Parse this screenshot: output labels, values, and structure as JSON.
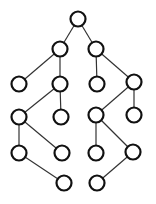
{
  "diagram": {
    "type": "tree",
    "node_radius": 7.5,
    "colors": {
      "node_stroke": "#111111",
      "node_fill": "#ffffff",
      "edge": "#333333",
      "background": "#ffffff"
    },
    "nodes": [
      {
        "id": "n0",
        "x": 78,
        "y": 19
      },
      {
        "id": "n1",
        "x": 60,
        "y": 49
      },
      {
        "id": "n2",
        "x": 96,
        "y": 49
      },
      {
        "id": "n3",
        "x": 19,
        "y": 84
      },
      {
        "id": "n4",
        "x": 60,
        "y": 84
      },
      {
        "id": "n5",
        "x": 97,
        "y": 84
      },
      {
        "id": "n6",
        "x": 134,
        "y": 82
      },
      {
        "id": "n7",
        "x": 19,
        "y": 117
      },
      {
        "id": "n8",
        "x": 61,
        "y": 117
      },
      {
        "id": "n9",
        "x": 96,
        "y": 115
      },
      {
        "id": "n10",
        "x": 134,
        "y": 115
      },
      {
        "id": "n11",
        "x": 19,
        "y": 153
      },
      {
        "id": "n12",
        "x": 62,
        "y": 153
      },
      {
        "id": "n13",
        "x": 96,
        "y": 153
      },
      {
        "id": "n14",
        "x": 133,
        "y": 152
      },
      {
        "id": "n15",
        "x": 64,
        "y": 183
      },
      {
        "id": "n16",
        "x": 97,
        "y": 183
      }
    ],
    "edges": [
      [
        "n0",
        "n1"
      ],
      [
        "n0",
        "n2"
      ],
      [
        "n1",
        "n3"
      ],
      [
        "n1",
        "n4"
      ],
      [
        "n2",
        "n5"
      ],
      [
        "n2",
        "n6"
      ],
      [
        "n4",
        "n7"
      ],
      [
        "n4",
        "n8"
      ],
      [
        "n6",
        "n9"
      ],
      [
        "n6",
        "n10"
      ],
      [
        "n7",
        "n11"
      ],
      [
        "n7",
        "n12"
      ],
      [
        "n9",
        "n13"
      ],
      [
        "n9",
        "n14"
      ],
      [
        "n11",
        "n15"
      ],
      [
        "n14",
        "n16"
      ]
    ]
  }
}
